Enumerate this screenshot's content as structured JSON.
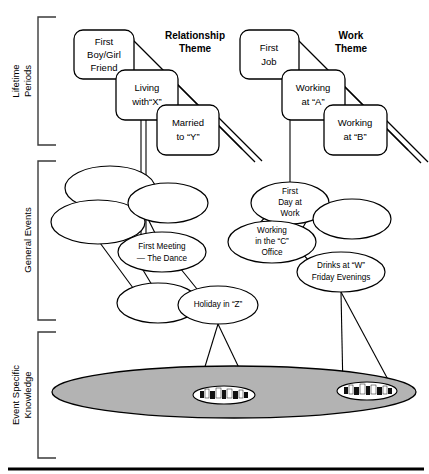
{
  "figure": {
    "background_color": "#ffffff",
    "line_color": "#000000",
    "base_fill_color": "#b3b3b3"
  },
  "levels": [
    {
      "id": "lifetime-periods",
      "label": "Lifetime\nPeriods",
      "line1": "Lifetime",
      "line2": "Periods"
    },
    {
      "id": "general-events",
      "label": "General Events",
      "line1": "General Events",
      "line2": ""
    },
    {
      "id": "event-specific-knowledge",
      "label": "Event Specific\nKnowledge",
      "line1": "Event Specific",
      "line2": "Knowledge"
    }
  ],
  "themes": [
    {
      "id": "relationship-theme",
      "line1": "Relationship",
      "line2": "Theme"
    },
    {
      "id": "work-theme",
      "line1": "Work",
      "line2": "Theme"
    }
  ],
  "lifetime_period_boxes": [
    {
      "id": "first-boy-girl-friend",
      "lines": [
        "First",
        "Boy/Girl",
        "Friend"
      ],
      "theme": "relationship-theme"
    },
    {
      "id": "living-with-x",
      "lines": [
        "Living",
        "with“X”"
      ],
      "theme": "relationship-theme"
    },
    {
      "id": "married-to-y",
      "lines": [
        "Married",
        "to “Y”"
      ],
      "theme": "relationship-theme"
    },
    {
      "id": "first-job",
      "lines": [
        "First",
        "Job"
      ],
      "theme": "work-theme"
    },
    {
      "id": "working-at-a",
      "lines": [
        "Working",
        "at “A”"
      ],
      "theme": "work-theme"
    },
    {
      "id": "working-at-b",
      "lines": [
        "Working",
        "at “B”"
      ],
      "theme": "work-theme"
    }
  ],
  "general_event_ovals": [
    {
      "id": "general-event-unlabeled-1",
      "lines": []
    },
    {
      "id": "general-event-unlabeled-2",
      "lines": []
    },
    {
      "id": "general-event-unlabeled-3",
      "lines": []
    },
    {
      "id": "first-meeting-the-dance",
      "lines": [
        "First Meeting",
        "— The Dance"
      ]
    },
    {
      "id": "general-event-unlabeled-4",
      "lines": []
    },
    {
      "id": "holiday-in-z",
      "lines": [
        "Holiday in “Z”"
      ]
    },
    {
      "id": "first-day-at-work",
      "lines": [
        "First",
        "Day at",
        "Work"
      ]
    },
    {
      "id": "general-event-unlabeled-5",
      "lines": []
    },
    {
      "id": "working-in-the-c-office",
      "lines": [
        "Working",
        "in the “C”",
        "Office"
      ]
    },
    {
      "id": "drinks-at-w-friday-evenings",
      "lines": [
        "Drinks at “W”",
        "Friday Evenings"
      ]
    }
  ],
  "event_specific_clusters": [
    {
      "id": "esk-cluster-left",
      "source": "holiday-in-z",
      "mark_count": 7
    },
    {
      "id": "esk-cluster-right",
      "source": "drinks-at-w-friday-evenings",
      "mark_count": 7
    }
  ]
}
